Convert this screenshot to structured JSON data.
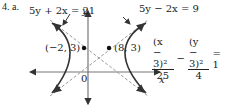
{
  "problem": {
    "label": "4. a."
  },
  "equations": {
    "asymptote_1": "5y + 2x = 21",
    "asymptote_2": "5y − 2x = 9",
    "hyperbola": {
      "term1_num": "(x − 3)²",
      "term1_den": "25",
      "minus": "−",
      "term2_num": "(y − 3)²",
      "term2_den": "4",
      "rhs": "= 1"
    }
  },
  "points": {
    "vertex_left": "(−2, 3)",
    "vertex_right": "(8, 3)"
  },
  "axes": {
    "x_label": "x",
    "y_label": "y",
    "origin_label": "0"
  },
  "colors": {
    "curve": "#333333",
    "axis": "#777777",
    "asymptote": "#999999"
  }
}
